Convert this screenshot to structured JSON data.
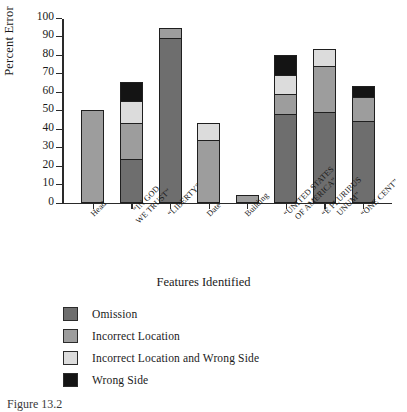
{
  "chart_data": {
    "type": "bar",
    "subtype": "stacked-bar",
    "title": "",
    "xlabel": "Features Identified",
    "ylabel": "Percent Error",
    "ylim": [
      0,
      100
    ],
    "ytick_labels": [
      "0",
      "10",
      "20",
      "30",
      "40",
      "50",
      "60",
      "70",
      "80",
      "90",
      "100"
    ],
    "ytick_values": [
      0,
      10,
      20,
      30,
      40,
      50,
      60,
      70,
      80,
      90,
      100
    ],
    "grid": false,
    "legend_position": "below-plot-left",
    "categories": [
      "Head",
      "“IN GOD WE TRUST”",
      "“LIBERTY”",
      "Date",
      "Building",
      "“UNITED STATES OF AMERICA”",
      "“E PLURIBUS UNUM”",
      "“ONE CENT”"
    ],
    "category_lines": [
      [
        "Head"
      ],
      [
        "“IN GOD",
        "WE TRUST”"
      ],
      [
        "“LIBERTY”"
      ],
      [
        "Date"
      ],
      [
        "Building"
      ],
      [
        "“UNITED STATES",
        "OF AMERICA”"
      ],
      [
        "“E PLURIBUS",
        "UNUM”"
      ],
      [
        "“ONE CENT”"
      ]
    ],
    "series": [
      {
        "name": "Omission",
        "color": "#6e6e6e",
        "values": [
          0,
          23.5,
          89,
          0,
          0,
          48,
          49,
          44
        ]
      },
      {
        "name": "Incorrect Location",
        "color": "#9d9d9d",
        "values": [
          50,
          19.5,
          5.5,
          34,
          4,
          10.5,
          25,
          13
        ]
      },
      {
        "name": "Incorrect Location and Wrong Side",
        "color": "#dcdcdc",
        "values": [
          0,
          12,
          0,
          9,
          0,
          10.5,
          9,
          0
        ]
      },
      {
        "name": "Wrong Side",
        "color": "#141414",
        "values": [
          0,
          10,
          0,
          0,
          0,
          10.5,
          0,
          6
        ]
      }
    ],
    "totals": [
      50,
      65,
      94.5,
      43,
      4,
      79.5,
      83,
      63
    ]
  },
  "legend": {
    "items": [
      {
        "label": "Omission",
        "color": "#6e6e6e"
      },
      {
        "label": "Incorrect Location",
        "color": "#9d9d9d"
      },
      {
        "label": "Incorrect Location and Wrong Side",
        "color": "#dcdcdc"
      },
      {
        "label": "Wrong Side",
        "color": "#141414"
      }
    ]
  },
  "caption": {
    "text": "Figure 13.2"
  }
}
